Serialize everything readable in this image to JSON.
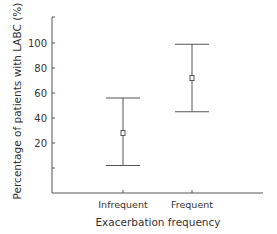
{
  "chart_data": {
    "type": "errorbar",
    "title": "",
    "xlabel": "Exacerbation frequency",
    "ylabel": "Percentage of patients with LABC (%)",
    "categories": [
      "Infrequent",
      "Frequent"
    ],
    "series": [
      {
        "name": "Percentage of patients with LABC",
        "values": [
          28,
          72
        ],
        "lower": [
          2,
          45
        ],
        "upper": [
          56,
          99
        ]
      }
    ],
    "yticks": [
      20,
      40,
      60,
      80,
      100
    ],
    "ytick_labels": [
      "20",
      "40",
      "60",
      "80",
      "100"
    ],
    "ylim": [
      -20,
      120
    ],
    "grid": false,
    "legend": null,
    "colors": {
      "axis": "#555555",
      "text": "#333333",
      "marker_fill": "#ffffff"
    }
  }
}
